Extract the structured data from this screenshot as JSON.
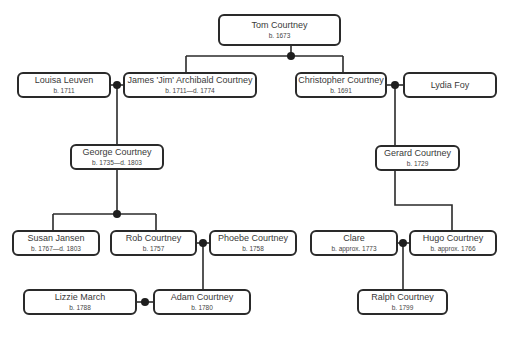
{
  "diagram": {
    "type": "family-tree",
    "colors": {
      "line": "#2a2a2a",
      "box_border": "#2a2a2a",
      "text": "#3a3a3a",
      "background": "#ffffff"
    },
    "people": [
      {
        "id": "tom",
        "name": "Tom Courtney",
        "dates": "b. 1673",
        "box": [
          218,
          14,
          123,
          32
        ]
      },
      {
        "id": "louisa",
        "name": "Louisa Leuven",
        "dates": "b. 1711",
        "box": [
          17,
          72,
          94,
          26
        ]
      },
      {
        "id": "jim",
        "name": "James 'Jim' Archibald Courtney",
        "dates": "b. 1711—d. 1774",
        "box": [
          123,
          72,
          134,
          26
        ]
      },
      {
        "id": "christopher",
        "name": "Christopher Courtney",
        "dates": "b. 1691",
        "box": [
          295,
          72,
          92,
          26
        ]
      },
      {
        "id": "lydia",
        "name": "Lydia Foy",
        "dates": "",
        "box": [
          403,
          72,
          94,
          26
        ]
      },
      {
        "id": "george",
        "name": "George Courtney",
        "dates": "b. 1735—d. 1803",
        "box": [
          70,
          144,
          94,
          26
        ]
      },
      {
        "id": "gerard",
        "name": "Gerard Courtney",
        "dates": "b. 1729",
        "box": [
          375,
          145,
          85,
          26
        ]
      },
      {
        "id": "susan",
        "name": "Susan Jansen",
        "dates": "b. 1767—d. 1803",
        "box": [
          12,
          230,
          88,
          26
        ]
      },
      {
        "id": "rob",
        "name": "Rob Courtney",
        "dates": "b. 1757",
        "box": [
          110,
          230,
          87,
          26
        ]
      },
      {
        "id": "phoebe",
        "name": "Phoebe Courtney",
        "dates": "b. 1758",
        "box": [
          209,
          230,
          88,
          26
        ]
      },
      {
        "id": "clare",
        "name": "Clare",
        "dates": "b. approx. 1773",
        "box": [
          310,
          230,
          88,
          26
        ]
      },
      {
        "id": "hugo",
        "name": "Hugo Courtney",
        "dates": "b. approx. 1766",
        "box": [
          409,
          230,
          88,
          26
        ]
      },
      {
        "id": "lizzie",
        "name": "Lizzie March",
        "dates": "b. 1788",
        "box": [
          23,
          289,
          114,
          26
        ]
      },
      {
        "id": "adam",
        "name": "Adam Courtney",
        "dates": "b. 1780",
        "box": [
          153,
          289,
          98,
          26
        ]
      },
      {
        "id": "ralph",
        "name": "Ralph Courtney",
        "dates": "b. 1799",
        "box": [
          357,
          289,
          91,
          26
        ]
      }
    ],
    "unions": [
      {
        "partners": [
          "louisa",
          "jim"
        ],
        "dot": [
          117,
          85
        ]
      },
      {
        "partners": [
          "christopher",
          "lydia"
        ],
        "dot": [
          395,
          85
        ]
      },
      {
        "partners": [
          "rob",
          "phoebe"
        ],
        "dot": [
          203,
          243
        ]
      },
      {
        "partners": [
          "clare",
          "hugo"
        ],
        "dot": [
          403,
          243
        ]
      },
      {
        "partners": [
          "lizzie",
          "adam"
        ],
        "dot": [
          145,
          302
        ]
      }
    ],
    "descent": [
      {
        "from": "tom",
        "children": [
          "jim",
          "christopher"
        ],
        "dot": [
          291,
          56
        ]
      },
      {
        "from": "louisa+jim",
        "children": [
          "george"
        ]
      },
      {
        "from": "george",
        "children": [
          "susan",
          "rob"
        ],
        "dot": [
          117,
          214
        ]
      },
      {
        "from": "christopher+lydia",
        "children": [
          "gerard"
        ]
      },
      {
        "from": "gerard",
        "children": [
          "hugo"
        ]
      },
      {
        "from": "rob+phoebe",
        "children": [
          "adam"
        ]
      },
      {
        "from": "clare+hugo",
        "children": [
          "ralph"
        ]
      }
    ]
  }
}
